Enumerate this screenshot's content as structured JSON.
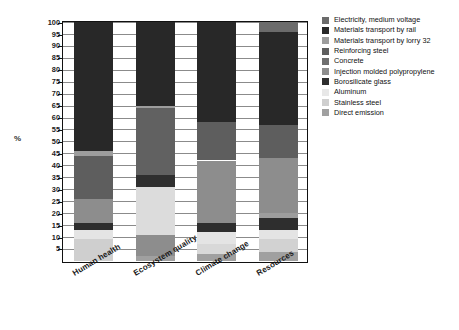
{
  "chart_data": {
    "type": "bar",
    "stacked": true,
    "normalized_percent": true,
    "title": "",
    "xlabel": "",
    "ylabel": "%",
    "ylim": [
      0,
      100
    ],
    "ytick_labels": [
      "100",
      "95",
      "90",
      "85",
      "80",
      "75",
      "70",
      "65",
      "60",
      "55",
      "50",
      "45",
      "40",
      "35",
      "30",
      "25",
      "20",
      "15",
      "10",
      "5"
    ],
    "ytick_values": [
      100,
      95,
      90,
      85,
      80,
      75,
      70,
      65,
      60,
      55,
      50,
      45,
      40,
      35,
      30,
      25,
      20,
      15,
      10,
      5
    ],
    "grid": true,
    "legend_position": "right",
    "categories": [
      "Human health",
      "Ecosystem quality",
      "Climate change",
      "Resources"
    ],
    "series": [
      {
        "name": "Electricity, medium voltage",
        "color": "#6b6b6b",
        "values": [
          0.0,
          0.0,
          0.0,
          4.0
        ]
      },
      {
        "name": "Materials transport by rail",
        "color": "#282828",
        "values": [
          54.0,
          35.0,
          42.0,
          39.0
        ]
      },
      {
        "name": "Materials transport by lorry 32",
        "color": "#909090",
        "values": [
          2.0,
          1.0,
          0.0,
          0.0
        ]
      },
      {
        "name": "Reinforcing steel",
        "color": "#5a5a5a",
        "values": [
          18.0,
          28.0,
          16.0,
          14.0
        ]
      },
      {
        "name": "Concrete",
        "color": "#6e6e6e",
        "values": [
          0.0,
          5.0,
          0.0,
          0.0
        ]
      },
      {
        "name": "Injection molded polypropylene",
        "color": "#8d8d8d",
        "values": [
          10.0,
          20.0,
          26.0,
          23.0
        ]
      },
      {
        "name": "Borosilicate glass",
        "color": "#2e2e2e",
        "values": [
          3.0,
          0.0,
          4.0,
          2.0
        ]
      },
      {
        "name": "Aluminum",
        "color": "#dcdcdc",
        "values": [
          4.0,
          9.0,
          5.0,
          5.0
        ]
      },
      {
        "name": "Stainless steel",
        "color": "#cfcfcf",
        "values": [
          9.0,
          0.0,
          4.0,
          9.5
        ]
      },
      {
        "name": "Direct emission",
        "color": "#9a9a9a",
        "values": [
          0.0,
          2.0,
          3.0,
          3.5
        ]
      }
    ],
    "stack_segments": {
      "Human health": [
        {
          "label": "Stainless steel",
          "from": 0.0,
          "to": 9.0,
          "color": "#cfcfcf"
        },
        {
          "label": "Aluminum",
          "from": 9.0,
          "to": 13.0,
          "color": "#e4e4e4"
        },
        {
          "label": "Borosilicate glass",
          "from": 13.0,
          "to": 16.0,
          "color": "#2e2e2e"
        },
        {
          "label": "Injection molded polypropylene",
          "from": 16.0,
          "to": 26.0,
          "color": "#8d8d8d"
        },
        {
          "label": "Reinforcing steel",
          "from": 26.0,
          "to": 44.0,
          "color": "#5e5e5e"
        },
        {
          "label": "Materials transport by lorry 32",
          "from": 44.0,
          "to": 46.0,
          "color": "#9d9d9d"
        },
        {
          "label": "Materials transport by rail",
          "from": 46.0,
          "to": 100.0,
          "color": "#282828"
        }
      ],
      "Ecosystem quality": [
        {
          "label": "Direct emission",
          "from": 0.0,
          "to": 2.0,
          "color": "#a0a0a0"
        },
        {
          "label": "Aluminum",
          "from": 2.0,
          "to": 11.0,
          "color": "#8d8d8d"
        },
        {
          "label": "Injection molded polypropylene",
          "from": 11.0,
          "to": 31.0,
          "color": "#dcdcdc"
        },
        {
          "label": "Concrete",
          "from": 31.0,
          "to": 36.0,
          "color": "#2f2f2f"
        },
        {
          "label": "Reinforcing steel",
          "from": 36.0,
          "to": 64.0,
          "color": "#616161"
        },
        {
          "label": "Materials transport by lorry 32",
          "from": 64.0,
          "to": 65.0,
          "color": "#9d9d9d"
        },
        {
          "label": "Materials transport by rail",
          "from": 65.0,
          "to": 100.0,
          "color": "#282828"
        }
      ],
      "Climate change": [
        {
          "label": "Direct emission",
          "from": 0.0,
          "to": 3.0,
          "color": "#a0a0a0"
        },
        {
          "label": "Stainless steel",
          "from": 3.0,
          "to": 7.0,
          "color": "#d8d8d8"
        },
        {
          "label": "Aluminum",
          "from": 7.0,
          "to": 12.0,
          "color": "#e4e4e4"
        },
        {
          "label": "Borosilicate glass",
          "from": 12.0,
          "to": 16.0,
          "color": "#2e2e2e"
        },
        {
          "label": "Injection molded polypropylene",
          "from": 16.0,
          "to": 42.0,
          "color": "#8d8d8d"
        },
        {
          "label": "Reinforcing steel",
          "from": 42.0,
          "to": 58.0,
          "color": "#5e5e5e"
        },
        {
          "label": "Materials transport by rail",
          "from": 58.0,
          "to": 100.0,
          "color": "#282828"
        }
      ],
      "Resources": [
        {
          "label": "Direct emission",
          "from": 0.0,
          "to": 3.5,
          "color": "#a0a0a0"
        },
        {
          "label": "Stainless steel",
          "from": 3.5,
          "to": 9.0,
          "color": "#d2d2d2"
        },
        {
          "label": "Aluminum",
          "from": 9.0,
          "to": 13.0,
          "color": "#e4e4e4"
        },
        {
          "label": "Borosilicate glass",
          "from": 13.0,
          "to": 18.0,
          "color": "#2e2e2e"
        },
        {
          "label": "Materials transport by lorry 32",
          "from": 18.0,
          "to": 20.0,
          "color": "#9d9d9d"
        },
        {
          "label": "Injection molded polypropylene",
          "from": 20.0,
          "to": 43.0,
          "color": "#8d8d8d"
        },
        {
          "label": "Reinforcing steel",
          "from": 43.0,
          "to": 57.0,
          "color": "#5e5e5e"
        },
        {
          "label": "Materials transport by rail",
          "from": 57.0,
          "to": 96.0,
          "color": "#282828"
        },
        {
          "label": "Electricity, medium voltage",
          "from": 96.0,
          "to": 100.0,
          "color": "#6b6b6b"
        }
      ]
    },
    "legend": [
      {
        "label": "Electricity, medium voltage",
        "color": "#6b6b6b"
      },
      {
        "label": "Materials transport by rail",
        "color": "#282828"
      },
      {
        "label": "Materials transport by lorry 32",
        "color": "#9d9d9d"
      },
      {
        "label": "Reinforcing steel",
        "color": "#5e5e5e"
      },
      {
        "label": "Concrete",
        "color": "#6e6e6e"
      },
      {
        "label": "Injection molded polypropylene",
        "color": "#8d8d8d"
      },
      {
        "label": "Borosilicate glass",
        "color": "#2e2e2e"
      },
      {
        "label": "Aluminum",
        "color": "#e8e8e8"
      },
      {
        "label": "Stainless steel",
        "color": "#cfcfcf"
      },
      {
        "label": "Direct emission",
        "color": "#a0a0a0"
      }
    ]
  }
}
